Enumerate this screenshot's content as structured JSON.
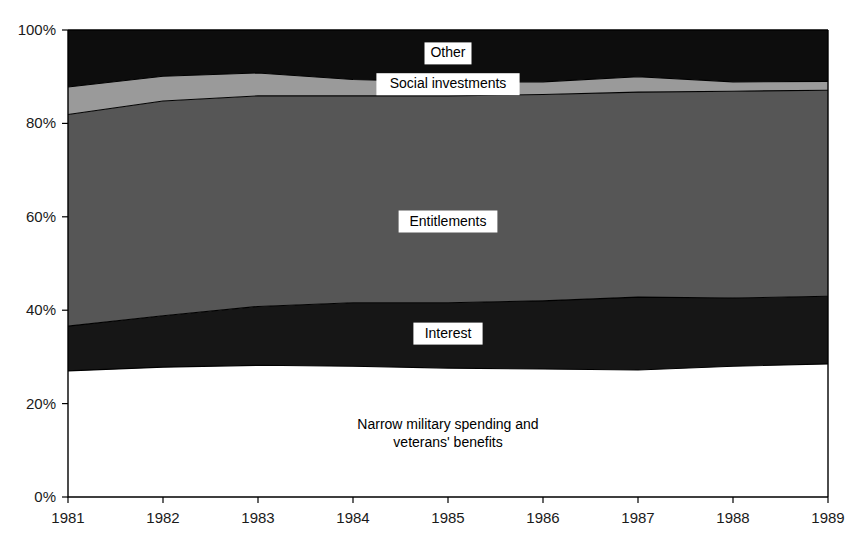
{
  "chart_data": {
    "type": "area",
    "title": "",
    "subtitle": "",
    "xlabel": "",
    "ylabel": "",
    "stacked": true,
    "normalized": true,
    "grid": false,
    "legend_position": "inline-labels",
    "x": [
      1981,
      1982,
      1983,
      1984,
      1985,
      1986,
      1987,
      1988,
      1989
    ],
    "xtick_labels": [
      "1981",
      "1982",
      "1983",
      "1984",
      "1985",
      "1986",
      "1987",
      "1988",
      "1989"
    ],
    "ytick_labels": [
      "0%",
      "20%",
      "40%",
      "60%",
      "80%",
      "100%"
    ],
    "ytick_values": [
      0,
      20,
      40,
      60,
      80,
      100
    ],
    "ylim": [
      0,
      100
    ],
    "xlim": [
      1981,
      1989
    ],
    "series": [
      {
        "name": "Narrow military spending and veterans' benefits",
        "label_lines": [
          "Narrow military spending and",
          "veterans' benefits"
        ],
        "color": "#ffffff",
        "values": [
          27.0,
          27.8,
          28.2,
          28.0,
          27.6,
          27.4,
          27.2,
          28.0,
          28.5
        ]
      },
      {
        "name": "Interest",
        "label_lines": [
          "Interest"
        ],
        "color": "#161616",
        "values": [
          9.6,
          11.0,
          12.6,
          13.6,
          14.0,
          14.6,
          15.6,
          14.6,
          14.5
        ]
      },
      {
        "name": "Entitlements",
        "label_lines": [
          "Entitlements"
        ],
        "color": "#565656",
        "values": [
          45.3,
          46.0,
          45.1,
          44.3,
          44.3,
          44.2,
          43.9,
          44.3,
          44.1
        ]
      },
      {
        "name": "Social investments",
        "label_lines": [
          "Social investments"
        ],
        "color": "#9a9a9a",
        "values": [
          5.9,
          5.3,
          4.9,
          3.5,
          3.0,
          2.7,
          3.3,
          2.0,
          1.9
        ]
      },
      {
        "name": "Other",
        "label_lines": [
          "Other"
        ],
        "color": "#0d0d0d",
        "values": [
          12.2,
          9.9,
          9.2,
          10.6,
          11.1,
          11.1,
          10.0,
          11.1,
          11.0
        ]
      }
    ],
    "cumulative_upper_bounds": {
      "military_top": [
        27.0,
        27.8,
        28.2,
        28.0,
        27.6,
        27.4,
        27.2,
        28.0,
        28.5
      ],
      "interest_top": [
        36.6,
        38.8,
        40.8,
        41.6,
        41.6,
        42.0,
        42.8,
        42.6,
        43.0
      ],
      "entitlements_top": [
        81.9,
        84.8,
        85.9,
        85.9,
        85.9,
        86.2,
        86.7,
        86.9,
        87.1
      ],
      "social_investments_top": [
        87.8,
        90.1,
        90.8,
        89.4,
        88.9,
        88.9,
        90.0,
        88.9,
        89.0
      ],
      "other_top": [
        100,
        100,
        100,
        100,
        100,
        100,
        100,
        100,
        100
      ]
    },
    "inline_label_positions": [
      {
        "series": "Other",
        "x": 1985.0,
        "y": 95.0
      },
      {
        "series": "Social investments",
        "x": 1985.0,
        "y": 88.4
      },
      {
        "series": "Entitlements",
        "x": 1985.0,
        "y": 59.0
      },
      {
        "series": "Interest",
        "x": 1985.0,
        "y": 35.0
      },
      {
        "series": "Narrow military spending and veterans' benefits",
        "x": 1985.0,
        "y": 13.5
      }
    ]
  }
}
